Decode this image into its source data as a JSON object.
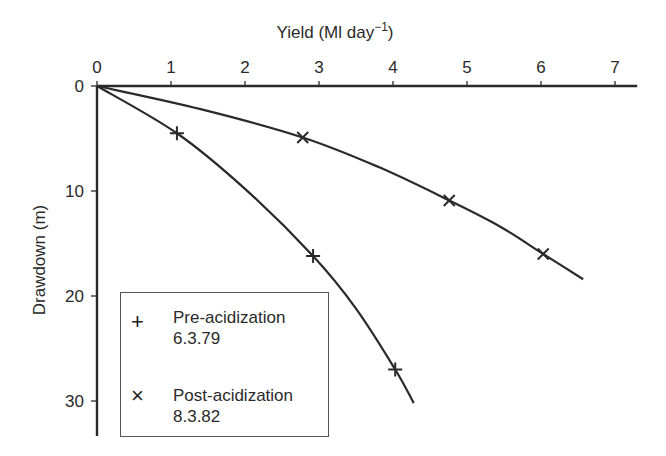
{
  "chart_data": {
    "type": "scatter",
    "title": "",
    "xlabel": "Yield (Ml day⁻¹)",
    "xlabel_main": "Yield (Ml day",
    "xlabel_sup": "−1",
    "xlabel_close": ")",
    "ylabel": "Drawdown (m)",
    "x_axis_position": "top",
    "y_inverted": true,
    "xlim": [
      0,
      7.3
    ],
    "ylim": [
      0,
      33
    ],
    "xticks": [
      0,
      1,
      2,
      3,
      4,
      5,
      6,
      7
    ],
    "yticks": [
      0,
      10,
      20,
      30
    ],
    "grid": false,
    "legend_position": "lower left",
    "series": [
      {
        "name": "Pre-acidization",
        "date": "6.3.79",
        "marker": "+",
        "points": [
          [
            1.08,
            4.5
          ],
          [
            2.92,
            16.2
          ],
          [
            4.03,
            27.0
          ]
        ],
        "curve": [
          [
            0,
            0
          ],
          [
            1.08,
            4.5
          ],
          [
            2.0,
            9.8
          ],
          [
            2.92,
            16.2
          ],
          [
            3.5,
            21.2
          ],
          [
            4.03,
            27.0
          ],
          [
            4.28,
            30.2
          ]
        ]
      },
      {
        "name": "Post-acidization",
        "date": "8.3.82",
        "marker": "×",
        "points": [
          [
            2.78,
            4.9
          ],
          [
            4.76,
            10.9
          ],
          [
            6.03,
            16.0
          ]
        ],
        "curve": [
          [
            0,
            0
          ],
          [
            1.4,
            2.2
          ],
          [
            2.78,
            4.9
          ],
          [
            3.8,
            7.7
          ],
          [
            4.76,
            10.9
          ],
          [
            5.45,
            13.4
          ],
          [
            6.03,
            16.0
          ],
          [
            6.57,
            18.4
          ]
        ]
      }
    ]
  }
}
